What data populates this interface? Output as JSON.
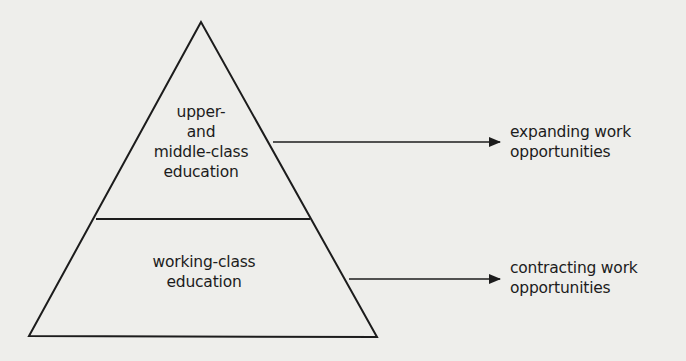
{
  "diagram": {
    "type": "pyramid",
    "colors": {
      "background": "#eeeeeb",
      "ink": "#1c1c1c"
    },
    "tiers": [
      {
        "id": "upper-middle",
        "label_lines": [
          "upper-",
          "and",
          "middle-class",
          "education"
        ],
        "outcome_lines": [
          "expanding work",
          "opportunities"
        ]
      },
      {
        "id": "working",
        "label_lines": [
          "working-class",
          "education"
        ],
        "outcome_lines": [
          "contracting work",
          "opportunities"
        ]
      }
    ]
  }
}
